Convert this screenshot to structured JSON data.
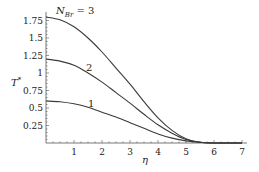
{
  "chart_data": {
    "type": "line",
    "title": "",
    "xlabel": "η",
    "ylabel": "T*",
    "xlim": [
      0,
      7.2
    ],
    "ylim": [
      0,
      1.85
    ],
    "grid": false,
    "legend": "inline curve labels",
    "x_ticks": [
      1,
      2,
      3,
      4,
      5,
      6,
      7
    ],
    "x_tick_labels": [
      "1",
      "2",
      "3",
      "4",
      "5",
      "6",
      "7"
    ],
    "y_ticks": [
      0.25,
      0.5,
      0.75,
      1,
      1.25,
      1.5,
      1.75
    ],
    "y_tick_labels": [
      "0.25",
      "0.5",
      "0.75",
      "1",
      "1.25",
      "1.5",
      "1.75"
    ],
    "x": [
      0,
      0.5,
      1,
      1.5,
      2,
      2.5,
      3,
      3.5,
      4,
      4.5,
      5,
      5.5,
      6,
      6.5,
      7
    ],
    "series": [
      {
        "name": "N_Br = 1",
        "label": "1",
        "label_pos": [
          1.6,
          0.58
        ],
        "values": [
          0.6,
          0.59,
          0.56,
          0.51,
          0.44,
          0.37,
          0.29,
          0.21,
          0.13,
          0.07,
          0.03,
          0.01,
          0.0,
          0.0,
          0.0
        ]
      },
      {
        "name": "N_Br = 2",
        "label": "2",
        "label_pos": [
          1.55,
          1.09
        ],
        "values": [
          1.2,
          1.17,
          1.11,
          1.0,
          0.87,
          0.72,
          0.57,
          0.41,
          0.26,
          0.14,
          0.05,
          0.01,
          0.0,
          0.0,
          0.0
        ]
      },
      {
        "name": "N_Br = 3",
        "label": "N_Br = 3",
        "label_pos": [
          0.4,
          1.83
        ],
        "values": [
          1.8,
          1.76,
          1.66,
          1.5,
          1.3,
          1.07,
          0.84,
          0.59,
          0.36,
          0.18,
          0.06,
          0.01,
          0.0,
          0.0,
          0.0
        ]
      }
    ],
    "annotations": [
      "N_Br = 3",
      "2",
      "1"
    ]
  },
  "labels": {
    "ylabel_main": "T",
    "ylabel_sup": "*",
    "xlabel": "η",
    "nbr_N": "N",
    "nbr_sub": "Br",
    "nbr_eq": " = 3",
    "curve2": "2",
    "curve1": "1"
  },
  "colors": {
    "line": "#3a3a3a",
    "axis": "#555555"
  }
}
